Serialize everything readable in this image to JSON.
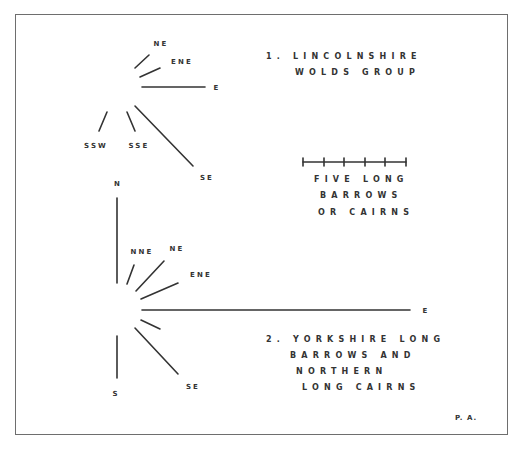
{
  "group1": {
    "title_lines": [
      "1. LINCOLNSHIRE",
      "WOLDS GROUP"
    ],
    "directions": [
      "NE",
      "ENE",
      "E",
      "SSW",
      "SSE",
      "SE"
    ]
  },
  "scale": {
    "ticks": 6,
    "label_lines": [
      "FIVE LONG",
      "BARROWS",
      "OR CAIRNS"
    ]
  },
  "group2": {
    "title_lines": [
      "2. YORKSHIRE LONG",
      "BARROWS AND",
      "NORTHERN",
      "LONG CAIRNS"
    ],
    "directions": [
      "N",
      "NNE",
      "NE",
      "ENE",
      "E",
      "SE",
      "S"
    ]
  },
  "credit": "P. A."
}
